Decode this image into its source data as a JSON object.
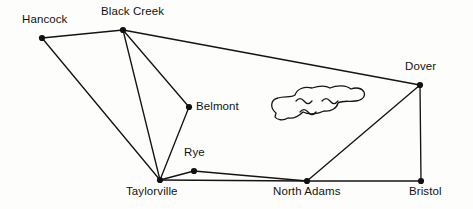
{
  "figure": {
    "kind": "node-link-map-diagram",
    "background_color": "#fdfdfb",
    "line_color": "#141414",
    "node_color": "#111111",
    "label_color": "#131313",
    "width": 473,
    "height": 209
  },
  "chart_data": {
    "type": "diagram",
    "title": "",
    "nodes": [
      {
        "id": "hancock",
        "label": "Hancock",
        "x": 42,
        "y": 38,
        "label_x": 22,
        "label_y": 14,
        "label_align": "left"
      },
      {
        "id": "black-creek",
        "label": "Black Creek",
        "x": 123,
        "y": 30,
        "label_x": 101,
        "label_y": 6,
        "label_align": "left"
      },
      {
        "id": "dover",
        "label": "Dover",
        "x": 420,
        "y": 85,
        "label_x": 405,
        "label_y": 61,
        "label_align": "left"
      },
      {
        "id": "belmont",
        "label": "Belmont",
        "x": 189,
        "y": 107,
        "label_x": 196,
        "label_y": 101,
        "label_align": "left"
      },
      {
        "id": "rye",
        "label": "Rye",
        "x": 194,
        "y": 171,
        "label_x": 184,
        "label_y": 147,
        "label_align": "left"
      },
      {
        "id": "taylorville",
        "label": "Taylorville",
        "x": 160,
        "y": 180,
        "label_x": 126,
        "label_y": 186,
        "label_align": "left"
      },
      {
        "id": "north-adams",
        "label": "North Adams",
        "x": 307,
        "y": 181,
        "label_x": 273,
        "label_y": 186,
        "label_align": "left"
      },
      {
        "id": "bristol",
        "label": "Bristol",
        "x": 421,
        "y": 181,
        "label_x": 409,
        "label_y": 186,
        "label_align": "left"
      }
    ],
    "edges": [
      {
        "from": "hancock",
        "to": "black-creek"
      },
      {
        "from": "hancock",
        "to": "taylorville"
      },
      {
        "from": "black-creek",
        "to": "taylorville"
      },
      {
        "from": "black-creek",
        "to": "belmont"
      },
      {
        "from": "black-creek",
        "to": "dover"
      },
      {
        "from": "belmont",
        "to": "taylorville"
      },
      {
        "from": "taylorville",
        "to": "rye"
      },
      {
        "from": "taylorville",
        "to": "north-adams"
      },
      {
        "from": "rye",
        "to": "north-adams"
      },
      {
        "from": "north-adams",
        "to": "dover"
      },
      {
        "from": "north-adams",
        "to": "bristol"
      },
      {
        "from": "dover",
        "to": "bristol"
      }
    ],
    "features": [
      {
        "id": "lake",
        "kind": "lake",
        "label": "",
        "outline": "M 276 113 C 270 108 270 100 278 98 C 284 96 291 98 295 95 C 297 89 304 86 312 88 C 318 86 325 85 330 88 C 337 85 346 85 351 89 C 356 87 362 88 364 92 C 366 97 361 101 355 101 C 349 102 343 100 338 103 C 337 108 331 112 324 111 C 318 114 309 115 303 112 C 299 116 294 119 288 118 C 283 121 277 120 275 117 Z",
        "waves": [
          "M 296 101 q 4 -5 8 0 q 4 5 8 0",
          "M 322 101 q 4 -5 8 0 q 4 5 8 0",
          "M 300 112 q 4 -5 8 0 q 4 5 8 0"
        ]
      }
    ],
    "axis": {
      "grid": false,
      "legend": false
    }
  }
}
